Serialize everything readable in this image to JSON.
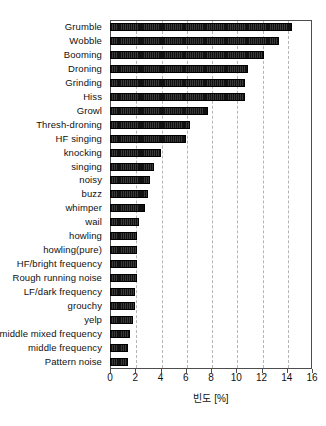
{
  "chart_data": {
    "type": "bar",
    "orientation": "horizontal",
    "title": "",
    "xlabel": "빈도 [%]",
    "ylabel": "",
    "xlim": [
      0,
      16
    ],
    "xticks": [
      0,
      2,
      4,
      6,
      8,
      10,
      12,
      14,
      16
    ],
    "grid": "vertical-dashed",
    "legend": "none",
    "bar_color": "#111111",
    "categories": [
      "Grumble",
      "Wobble",
      "Booming",
      "Droning",
      "Grinding",
      "Hiss",
      "Growl",
      "Thresh-droning",
      "HF singing",
      "knocking",
      "singing",
      "noisy",
      "buzz",
      "whimper",
      "wail",
      "howling",
      "howling(pure)",
      "HF/bright frequency",
      "Rough running noise",
      "LF/dark frequency",
      "grouchy",
      "yelp",
      "middle mixed frequency",
      "middle frequency",
      "Pattern noise"
    ],
    "values": [
      14.4,
      13.4,
      12.2,
      10.9,
      10.7,
      10.7,
      7.8,
      6.3,
      6.0,
      4.0,
      3.5,
      3.2,
      3.0,
      2.8,
      2.3,
      2.1,
      2.1,
      2.1,
      2.1,
      2.0,
      2.0,
      1.8,
      1.6,
      1.4,
      1.4
    ]
  }
}
